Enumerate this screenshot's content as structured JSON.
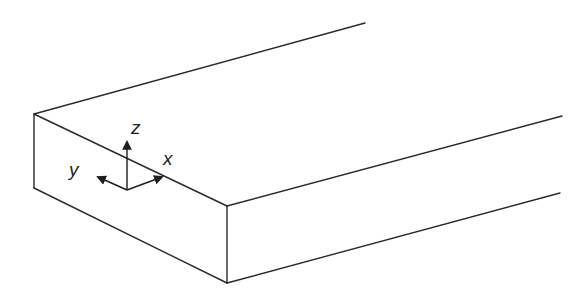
{
  "diagram": {
    "type": "isometric-slab",
    "stroke_color": "#2a2a2a",
    "background": "#ffffff",
    "axes": {
      "x": {
        "label": "x"
      },
      "y": {
        "label": "y"
      },
      "z": {
        "label": "z"
      }
    }
  }
}
